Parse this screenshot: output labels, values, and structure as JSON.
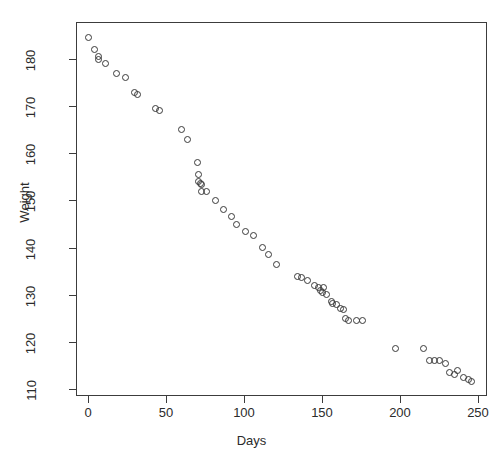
{
  "chart_data": {
    "type": "scatter",
    "title": "",
    "xlabel": "Days",
    "ylabel": "Weight",
    "xlim": [
      -5,
      250
    ],
    "ylim": [
      109,
      186
    ],
    "grid": false,
    "legend": "none",
    "marker": "open-circle",
    "marker_color": "#3a3a3a",
    "xticks": [
      0,
      50,
      100,
      150,
      200,
      250
    ],
    "xtick_labels": [
      "0",
      "50",
      "100",
      "150",
      "200",
      "250"
    ],
    "yticks": [
      110,
      120,
      130,
      140,
      150,
      160,
      170,
      180
    ],
    "ytick_labels": [
      "110",
      "120",
      "130",
      "140",
      "150",
      "160",
      "170",
      "180"
    ],
    "n_points": 62,
    "x": [
      0,
      4,
      7,
      7,
      11,
      18,
      24,
      30,
      32,
      43,
      46,
      60,
      64,
      70,
      71,
      71,
      72,
      73,
      73,
      76,
      82,
      87,
      92,
      95,
      101,
      106,
      112,
      116,
      121,
      134,
      137,
      141,
      145,
      148,
      149,
      150,
      151,
      153,
      156,
      157,
      159,
      162,
      164,
      165,
      167,
      172,
      176,
      197,
      215,
      219,
      222,
      225,
      229,
      232,
      235,
      237,
      241,
      244,
      246
    ],
    "y": [
      184.5,
      182.0,
      180.5,
      180.0,
      179.0,
      177.0,
      176.0,
      173.0,
      172.5,
      169.5,
      169.0,
      165.0,
      163.0,
      158.0,
      155.5,
      154.0,
      153.6,
      153.4,
      152.0,
      151.8,
      150.0,
      148.0,
      146.5,
      145.0,
      143.5,
      142.5,
      140.0,
      138.5,
      136.5,
      133.8,
      133.7,
      133.0,
      132.0,
      131.5,
      131.0,
      130.5,
      131.5,
      130.0,
      128.5,
      128.2,
      128.0,
      127.0,
      126.8,
      125.0,
      124.6,
      124.5,
      124.5,
      118.5,
      118.5,
      116.0,
      116.0,
      116.0,
      115.5,
      113.5,
      113.0,
      114.0,
      112.5,
      112.0,
      111.5
    ]
  }
}
